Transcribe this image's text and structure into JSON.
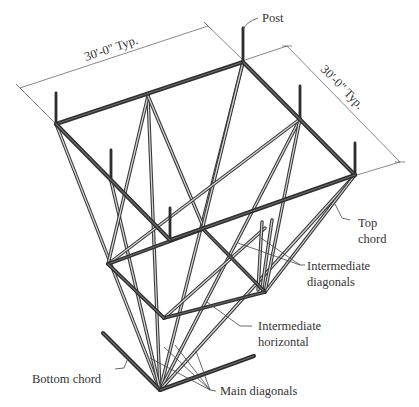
{
  "figure": {
    "type": "isometric structural diagram"
  },
  "dimensions": [
    {
      "id": "width",
      "text": "30'-0\" Typ."
    },
    {
      "id": "depth",
      "text": "30'-0\" Typ."
    }
  ],
  "labels": {
    "post": "Post",
    "top_chord_1": "Top",
    "top_chord_2": "chord",
    "intermediate_diagonals_1": "Intermediate",
    "intermediate_diagonals_2": "diagonals",
    "intermediate_horizontal_1": "Intermediate",
    "intermediate_horizontal_2": "horizontal",
    "bottom_chord": "Bottom chord",
    "main_diagonals": "Main diagonals"
  },
  "colors": {
    "member": "#3a3a3a",
    "member_highlight": "#d8d8d8",
    "dimension_line": "#555555",
    "text": "#333333"
  }
}
